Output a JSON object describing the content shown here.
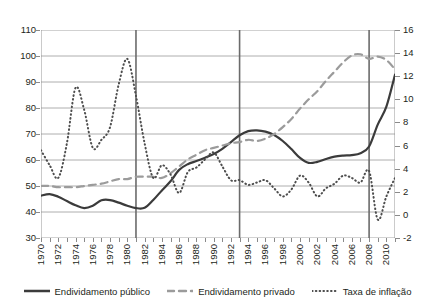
{
  "chart_data": {
    "type": "line",
    "title": "",
    "xlabel": "",
    "ylabel": "",
    "y2label": "",
    "grid": true,
    "legend_position": "bottom",
    "x": [
      1970,
      1971,
      1972,
      1973,
      1974,
      1975,
      1976,
      1977,
      1978,
      1979,
      1980,
      1981,
      1982,
      1983,
      1984,
      1985,
      1986,
      1987,
      1988,
      1989,
      1990,
      1991,
      1992,
      1993,
      1994,
      1995,
      1996,
      1997,
      1998,
      1999,
      2000,
      2001,
      2002,
      2003,
      2004,
      2005,
      2006,
      2007,
      2008,
      2009,
      2010,
      2011
    ],
    "xlim": [
      1970,
      2011
    ],
    "xticks": [
      1970,
      1972,
      1974,
      1976,
      1978,
      1980,
      1982,
      1984,
      1986,
      1988,
      1990,
      1992,
      1994,
      1996,
      1998,
      2000,
      2002,
      2004,
      2006,
      2008,
      2010
    ],
    "xticklabels": [
      "1970",
      "1972",
      "1974",
      "1976",
      "1978",
      "1980",
      "1982",
      "1984",
      "1986",
      "1988",
      "1990",
      "1992",
      "1994",
      "1996",
      "1998",
      "2000",
      "2002",
      "2004",
      "2006",
      "2008",
      "2010"
    ],
    "ylim": [
      30,
      110
    ],
    "yticks": [
      30,
      40,
      50,
      60,
      70,
      80,
      90,
      100,
      110
    ],
    "yticklabels": [
      "30",
      "40",
      "50",
      "60",
      "70",
      "80",
      "90",
      "100",
      "110"
    ],
    "y2lim": [
      -2,
      16
    ],
    "y2ticks": [
      -2,
      0,
      2,
      4,
      6,
      8,
      10,
      12,
      14,
      16
    ],
    "y2ticklabels": [
      "-2",
      "0",
      "2",
      "4",
      "6",
      "8",
      "10",
      "12",
      "14",
      "16"
    ],
    "vertical_reference_lines": [
      1981,
      1993,
      2008
    ],
    "series": [
      {
        "name": "Endividamento público",
        "axis": "left",
        "style": "solid",
        "color": "#3b3b3b",
        "values": [
          46.3,
          46.9,
          45.9,
          44.2,
          42.6,
          41.5,
          42.4,
          44.5,
          44.6,
          43.6,
          42.4,
          41.5,
          41.6,
          44.6,
          48.3,
          51.8,
          56.2,
          58.4,
          59.6,
          60.9,
          62.3,
          64.3,
          66.9,
          69.5,
          71.1,
          71.4,
          70.9,
          69.6,
          67.3,
          64.2,
          60.8,
          58.9,
          59.3,
          60.4,
          61.3,
          61.7,
          61.9,
          62.6,
          65.2,
          73.6,
          80.5,
          92.8
        ]
      },
      {
        "name": "Endividamento privado",
        "axis": "right",
        "style": "dashed",
        "color": "#9b9b9b",
        "values": [
          2.5,
          2.5,
          2.4,
          2.4,
          2.4,
          2.5,
          2.6,
          2.7,
          2.9,
          3.1,
          3.1,
          3.3,
          3.3,
          3.3,
          3.2,
          3.6,
          4.2,
          4.8,
          5.2,
          5.6,
          5.8,
          6.0,
          6.2,
          6.3,
          6.5,
          6.4,
          6.6,
          7.0,
          7.6,
          8.3,
          9.2,
          10.0,
          10.7,
          11.6,
          12.4,
          13.2,
          13.8,
          13.9,
          13.5,
          13.7,
          13.4,
          12.6
        ]
      },
      {
        "name": "Taxa de inflação",
        "axis": "right",
        "style": "dotted",
        "color": "#4d4d4d",
        "values": [
          5.6,
          4.3,
          3.2,
          6.2,
          11.0,
          9.1,
          5.8,
          6.5,
          7.6,
          11.3,
          13.5,
          10.3,
          6.2,
          3.2,
          4.3,
          3.5,
          1.9,
          3.7,
          4.1,
          4.8,
          5.4,
          4.2,
          3.0,
          3.0,
          2.6,
          2.8,
          3.0,
          2.3,
          1.6,
          2.2,
          3.4,
          2.8,
          1.6,
          2.3,
          2.7,
          3.4,
          3.2,
          2.8,
          3.8,
          -0.4,
          1.6,
          3.2
        ]
      }
    ]
  },
  "legend": {
    "items": [
      {
        "label": "Endividamento público",
        "style": "solid",
        "color": "#3b3b3b"
      },
      {
        "label": "Endividamento privado",
        "style": "dashed",
        "color": "#9b9b9b"
      },
      {
        "label": "Taxa de inflação",
        "style": "dotted",
        "color": "#4d4d4d"
      }
    ]
  }
}
